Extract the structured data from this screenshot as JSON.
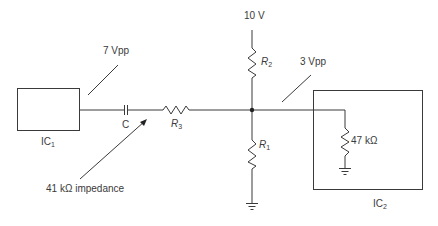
{
  "diagram": {
    "type": "circuit-schematic",
    "colors": {
      "wire": "#3a3a3a",
      "background": "#ffffff"
    },
    "labels": {
      "supply": "10 V",
      "ic1_signal": "7 Vpp",
      "ic2_signal": "3 Vpp",
      "ic1": {
        "base": "IC",
        "sub": "1"
      },
      "ic2": {
        "base": "IC",
        "sub": "2"
      },
      "capacitor": "C",
      "r1": {
        "base": "R",
        "sub": "1"
      },
      "r2": {
        "base": "R",
        "sub": "2"
      },
      "r3": {
        "base": "R",
        "sub": "3"
      },
      "load_resistor": "47 kΩ",
      "impedance_note": "41 kΩ impedance"
    },
    "components": [
      {
        "id": "IC1",
        "kind": "block"
      },
      {
        "id": "C",
        "kind": "capacitor"
      },
      {
        "id": "R3",
        "kind": "resistor"
      },
      {
        "id": "R2",
        "kind": "resistor",
        "to": "10 V"
      },
      {
        "id": "R1",
        "kind": "resistor",
        "to": "ground"
      },
      {
        "id": "IC2",
        "kind": "block",
        "contains": "47 kΩ resistor to ground"
      }
    ]
  }
}
